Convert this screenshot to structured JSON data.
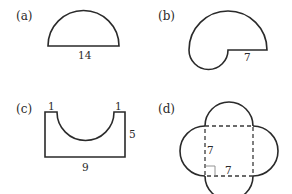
{
  "figure": {
    "panels": [
      {
        "id": "a",
        "label": "(a)",
        "shape": "semicircle",
        "dimensions": {
          "diameter": "14"
        }
      },
      {
        "id": "b",
        "label": "(b)",
        "shape": "large semicircle with small semicircle cut/joined",
        "dimensions": {
          "segment": "7"
        }
      },
      {
        "id": "c",
        "label": "(c)",
        "shape": "rectangle with semicircular cutout",
        "dimensions": {
          "left_ledge": "1",
          "right_ledge": "1",
          "height": "5",
          "width": "9"
        }
      },
      {
        "id": "d",
        "label": "(d)",
        "shape": "square with four semicircles",
        "dimensions": {
          "side_vertical": "7",
          "side_horizontal": "7"
        }
      }
    ]
  }
}
